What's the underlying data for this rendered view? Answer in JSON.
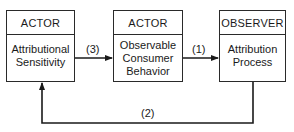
{
  "boxes": [
    {
      "header": "ACTOR",
      "body_lines": [
        "Attributional",
        "Sensitivity"
      ]
    },
    {
      "header": "ACTOR",
      "body_lines": [
        "Observable",
        "Consumer",
        "Behavior"
      ]
    },
    {
      "header": "OBSERVER",
      "body_lines": [
        "Attribution",
        "Process"
      ]
    }
  ],
  "arrows": [
    {
      "label": "(3)",
      "from": "Attributional Sensitivity",
      "to": "Observable Consumer Behavior"
    },
    {
      "label": "(1)",
      "from": "Observable Consumer Behavior",
      "to": "Attribution Process"
    },
    {
      "label": "(2)",
      "from": "Attribution Process",
      "to": "Attributional Sensitivity"
    }
  ],
  "colors": {
    "line": "#1a1a1a",
    "background": "#ffffff"
  }
}
